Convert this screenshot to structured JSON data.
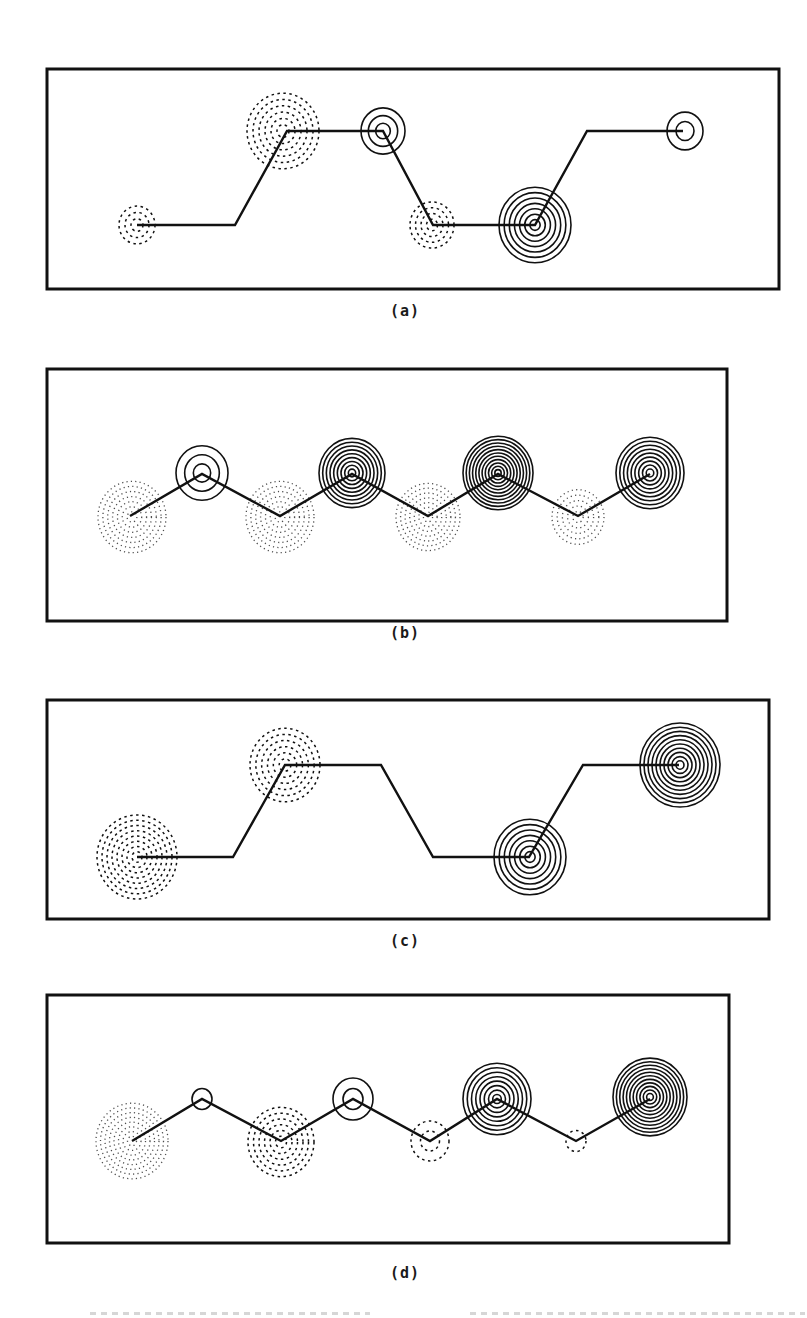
{
  "figure": {
    "background": "#ffffff",
    "ink_color": "#111111",
    "panels": [
      {
        "id": "a",
        "label": "(a)",
        "frame": {
          "x": 47,
          "y": 69,
          "w": 732,
          "h": 220
        },
        "label_pos": {
          "x": 405,
          "y": 312
        },
        "chain": [
          [
            137,
            225
          ],
          [
            235,
            225
          ],
          [
            287,
            131
          ],
          [
            383,
            131
          ],
          [
            433,
            225
          ],
          [
            535,
            225
          ],
          [
            587,
            131
          ],
          [
            683,
            131
          ]
        ],
        "lobes": [
          {
            "cx": 137,
            "cy": 225,
            "r": 18,
            "rings": 3,
            "sign": "negative"
          },
          {
            "cx": 283,
            "cy": 131,
            "r": 36,
            "rings": 6,
            "sign": "negative"
          },
          {
            "cx": 383,
            "cy": 131,
            "r": 22,
            "rings": 3,
            "sign": "positive"
          },
          {
            "cx": 432,
            "cy": 225,
            "r": 22,
            "rings": 4,
            "sign": "negative"
          },
          {
            "cx": 535,
            "cy": 225,
            "r": 36,
            "rings": 7,
            "sign": "positive"
          },
          {
            "cx": 685,
            "cy": 131,
            "r": 18,
            "rings": 2,
            "sign": "positive"
          }
        ]
      },
      {
        "id": "b",
        "label": "(b)",
        "frame": {
          "x": 47,
          "y": 369,
          "w": 680,
          "h": 252
        },
        "label_pos": {
          "x": 405,
          "y": 634
        },
        "chain": [
          [
            130,
            516
          ],
          [
            202,
            474
          ],
          [
            280,
            516
          ],
          [
            352,
            474
          ],
          [
            428,
            516
          ],
          [
            498,
            474
          ],
          [
            578,
            516
          ],
          [
            650,
            474
          ]
        ],
        "lobes": [
          {
            "cx": 132,
            "cy": 517,
            "r": 34,
            "rings": 7,
            "sign": "negative",
            "style": "dotted"
          },
          {
            "cx": 202,
            "cy": 473,
            "r": 26,
            "rings": 3,
            "sign": "positive"
          },
          {
            "cx": 280,
            "cy": 517,
            "r": 34,
            "rings": 7,
            "sign": "negative",
            "style": "dotted"
          },
          {
            "cx": 352,
            "cy": 473,
            "r": 33,
            "rings": 9,
            "sign": "positive"
          },
          {
            "cx": 428,
            "cy": 517,
            "r": 32,
            "rings": 7,
            "sign": "negative",
            "style": "dotted"
          },
          {
            "cx": 498,
            "cy": 473,
            "r": 35,
            "rings": 11,
            "sign": "positive"
          },
          {
            "cx": 578,
            "cy": 517,
            "r": 26,
            "rings": 5,
            "sign": "negative",
            "style": "dotted"
          },
          {
            "cx": 650,
            "cy": 473,
            "r": 34,
            "rings": 9,
            "sign": "positive"
          }
        ]
      },
      {
        "id": "c",
        "label": "(c)",
        "frame": {
          "x": 47,
          "y": 700,
          "w": 722,
          "h": 219
        },
        "label_pos": {
          "x": 405,
          "y": 942
        },
        "chain": [
          [
            137,
            857
          ],
          [
            233,
            857
          ],
          [
            285,
            765
          ],
          [
            381,
            765
          ],
          [
            433,
            857
          ],
          [
            529,
            857
          ],
          [
            583,
            765
          ],
          [
            679,
            765
          ]
        ],
        "lobes": [
          {
            "cx": 137,
            "cy": 857,
            "r": 40,
            "rings": 8,
            "sign": "negative"
          },
          {
            "cx": 285,
            "cy": 765,
            "r": 35,
            "rings": 6,
            "sign": "negative"
          },
          {
            "cx": 530,
            "cy": 857,
            "r": 36,
            "rings": 7,
            "sign": "positive"
          },
          {
            "cx": 680,
            "cy": 765,
            "r": 40,
            "rings": 10,
            "sign": "positive"
          }
        ]
      },
      {
        "id": "d",
        "label": "(d)",
        "frame": {
          "x": 47,
          "y": 995,
          "w": 682,
          "h": 248
        },
        "label_pos": {
          "x": 405,
          "y": 1274
        },
        "chain": [
          [
            132,
            1141
          ],
          [
            202,
            1099
          ],
          [
            281,
            1141
          ],
          [
            353,
            1099
          ],
          [
            430,
            1141
          ],
          [
            497,
            1099
          ],
          [
            576,
            1141
          ],
          [
            650,
            1099
          ]
        ],
        "lobes": [
          {
            "cx": 132,
            "cy": 1141,
            "r": 36,
            "rings": 8,
            "sign": "negative",
            "style": "dotted"
          },
          {
            "cx": 202,
            "cy": 1099,
            "r": 10,
            "rings": 1,
            "sign": "positive"
          },
          {
            "cx": 281,
            "cy": 1142,
            "r": 33,
            "rings": 6,
            "sign": "negative"
          },
          {
            "cx": 353,
            "cy": 1099,
            "r": 20,
            "rings": 2,
            "sign": "positive"
          },
          {
            "cx": 430,
            "cy": 1141,
            "r": 19,
            "rings": 2,
            "sign": "negative"
          },
          {
            "cx": 497,
            "cy": 1099,
            "r": 34,
            "rings": 8,
            "sign": "positive"
          },
          {
            "cx": 576,
            "cy": 1141,
            "r": 10,
            "rings": 1,
            "sign": "negative"
          },
          {
            "cx": 650,
            "cy": 1097,
            "r": 37,
            "rings": 11,
            "sign": "positive"
          }
        ]
      }
    ],
    "caption_partial": {
      "visible": true,
      "note": "clipped, illegible"
    }
  }
}
